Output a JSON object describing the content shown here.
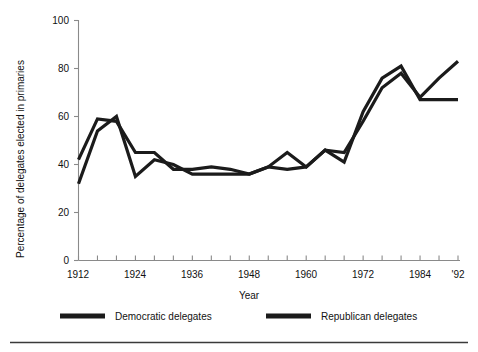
{
  "chart_data": {
    "type": "line",
    "title": "",
    "xlabel": "Year",
    "ylabel": "Percentage of delegates elected in primaries",
    "xlim": [
      1912,
      1992
    ],
    "ylim": [
      0,
      100
    ],
    "grid": false,
    "legend_position": "bottom",
    "x": [
      1912,
      1916,
      1920,
      1924,
      1928,
      1932,
      1936,
      1940,
      1944,
      1948,
      1952,
      1956,
      1960,
      1964,
      1968,
      1972,
      1976,
      1980,
      1984,
      1988,
      1992
    ],
    "x_tick_labels": [
      "1912",
      "1924",
      "1936",
      "1948",
      "1960",
      "1972",
      "1984",
      "'92"
    ],
    "x_tick_values": [
      1912,
      1924,
      1936,
      1948,
      1960,
      1972,
      1984,
      1992
    ],
    "x_minor_tick_step": 4,
    "y_tick_labels": [
      "0",
      "20",
      "40",
      "60",
      "80",
      "100"
    ],
    "y_tick_values": [
      0,
      20,
      40,
      60,
      80,
      100
    ],
    "series": [
      {
        "name": "Democratic delegates",
        "color": "#1b1b1b",
        "values": [
          32,
          54,
          60,
          35,
          42,
          40,
          36,
          36,
          36,
          36,
          39,
          38,
          39,
          46,
          41,
          62,
          76,
          81,
          67,
          67,
          67
        ]
      },
      {
        "name": "Republican delegates",
        "color": "#1b1b1b",
        "values": [
          42,
          59,
          58,
          45,
          45,
          38,
          38,
          39,
          38,
          36,
          39,
          45,
          39,
          46,
          45,
          58,
          72,
          78,
          68,
          76,
          83
        ]
      }
    ]
  },
  "axes": {
    "y_axis_title": "Percentage of delegates elected in primaries",
    "x_axis_title": "Year"
  },
  "legend": {
    "items": [
      {
        "label": "Democratic delegates"
      },
      {
        "label": "Republican delegates"
      }
    ]
  }
}
